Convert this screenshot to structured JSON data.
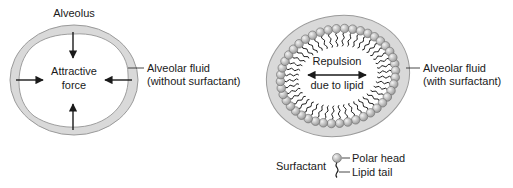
{
  "left_panel": {
    "title": "Alveolus",
    "center_label_line1": "Attractive",
    "center_label_line2": "force",
    "fluid_label_line1": "Alveolar fluid",
    "fluid_label_line2": "(without surfactant)"
  },
  "right_panel": {
    "center_label_line1": "Repulsion",
    "center_label_line2": "due to lipid",
    "fluid_label_line1": "Alveolar fluid",
    "fluid_label_line2": "(with surfactant)"
  },
  "legend": {
    "title": "Surfactant",
    "head_label": "Polar head",
    "tail_label": "Lipid tail"
  },
  "colors": {
    "fluid_fill": "#d9d9d9",
    "fluid_stroke": "#9a9a9a",
    "head_fill": "#c8c8c8",
    "ink": "#1a1a1a"
  }
}
